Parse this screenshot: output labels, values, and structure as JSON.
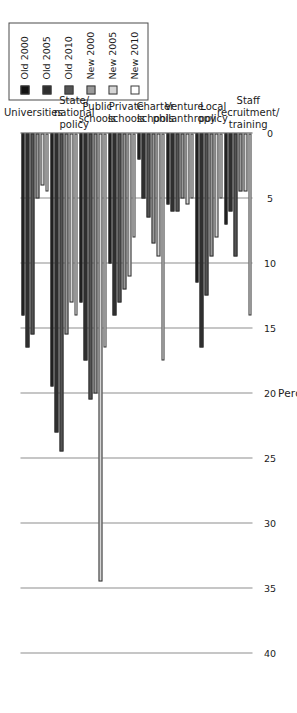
{
  "chart_data": {
    "type": "bar",
    "orientation": "horizontal",
    "title": "",
    "xlabel": "Percent",
    "ylabel": "",
    "xlim": [
      0,
      40
    ],
    "ticks": [
      0,
      5,
      10,
      15,
      20,
      25,
      30,
      35,
      40
    ],
    "grid": true,
    "legend_position": "top-left",
    "categories": [
      "Universities",
      "State/\nnational\npolicy",
      "Public\nschools",
      "Private\nschools",
      "Charter\nschools",
      "Venture\nphilanthropy",
      "Local\npolicy",
      "Staff\nrecruitment/\ntraining"
    ],
    "category_labels": [
      [
        "Universities"
      ],
      [
        "State/",
        "national",
        "policy"
      ],
      [
        "Public",
        "schools"
      ],
      [
        "Private",
        "schools"
      ],
      [
        "Charter",
        "schools"
      ],
      [
        "Venture",
        "philanthropy"
      ],
      [
        "Local",
        "policy"
      ],
      [
        "Staff",
        "recruitment/",
        "training"
      ]
    ],
    "series": [
      {
        "name": "Old 2000",
        "color": "#131313",
        "values": [
          14.0,
          19.5,
          13.0,
          10.0,
          2.0,
          5.5,
          11.5,
          7.0
        ]
      },
      {
        "name": "Old 2005",
        "color": "#2f2f2f",
        "values": [
          16.5,
          23.0,
          17.5,
          14.0,
          5.0,
          6.0,
          16.5,
          6.0
        ]
      },
      {
        "name": "Old 2010",
        "color": "#545454",
        "values": [
          15.5,
          24.5,
          20.5,
          13.0,
          6.5,
          6.0,
          12.5,
          9.5
        ]
      },
      {
        "name": "New 2000",
        "color": "#9a9a9a",
        "values": [
          5.0,
          15.5,
          20.0,
          12.0,
          8.5,
          5.0,
          9.5,
          4.5
        ]
      },
      {
        "name": "New 2005",
        "color": "#d6d6d6",
        "values": [
          4.0,
          13.0,
          34.5,
          11.0,
          9.5,
          5.5,
          8.0,
          4.5
        ]
      },
      {
        "name": "New 2010",
        "color": "#ffffff",
        "values": [
          4.5,
          14.0,
          16.5,
          8.0,
          17.5,
          5.0,
          5.0,
          14.0
        ]
      }
    ]
  },
  "legend": {
    "items": [
      {
        "label": "Old 2000",
        "color": "#131313"
      },
      {
        "label": "Old 2005",
        "color": "#2f2f2f"
      },
      {
        "label": "Old 2010",
        "color": "#545454"
      },
      {
        "label": "New 2000",
        "color": "#9a9a9a"
      },
      {
        "label": "New 2005",
        "color": "#d6d6d6"
      },
      {
        "label": "New 2010",
        "color": "#ffffff"
      }
    ]
  },
  "axis": {
    "title": "Percent",
    "tick_labels": [
      "40",
      "35",
      "30",
      "25",
      "20",
      "15",
      "10",
      "5",
      "0"
    ]
  }
}
